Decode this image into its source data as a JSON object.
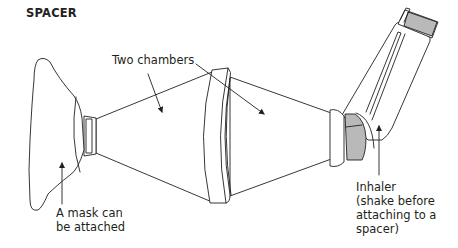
{
  "title": "SPACER",
  "labels": {
    "chambers": "Two chambers",
    "mask_line1": "A mask can",
    "mask_line2": "be attached",
    "inhaler_line1": "Inhaler",
    "inhaler_line2": "(shake before",
    "inhaler_line3": "attaching to a",
    "inhaler_line4": "spacer)"
  },
  "parts": [
    "mask",
    "first-chamber",
    "middle-ring",
    "second-chamber",
    "inhaler-adapter",
    "inhaler"
  ],
  "colors": {
    "line": "#231f20",
    "shading": "#b9b9b9",
    "background": "#ffffff"
  }
}
